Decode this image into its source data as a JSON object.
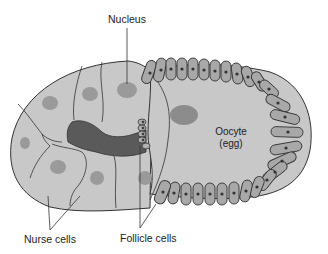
{
  "diagram": {
    "labels": {
      "nucleus": "Nucleus",
      "oocyte_line1": "Oocyte",
      "oocyte_line2": "(egg)",
      "nurse_cells": "Nurse cells",
      "follicle_cells": "Follicle cells"
    },
    "colors": {
      "cell_fill": "#c8c8c8",
      "nucleus_fill": "#9a9a9a",
      "cytoplasm_dark": "#5a5a5a",
      "follicle_fill": "#a8a8a8",
      "follicle_nucleus": "#3a3a3a",
      "outline": "#333333"
    }
  }
}
